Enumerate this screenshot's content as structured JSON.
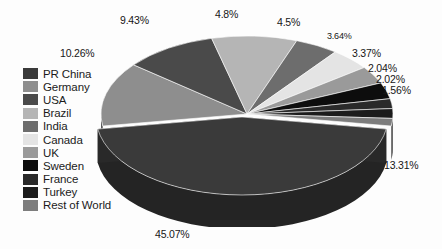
{
  "chart_data": {
    "type": "pie",
    "title": "",
    "subtitle": "",
    "xlabel": "",
    "ylabel": "",
    "style": "3d-exploded-grayscale",
    "legend_position": "left",
    "grid": false,
    "units": "percent",
    "categories": [
      "PR China",
      "Germany",
      "USA",
      "Brazil",
      "India",
      "Canada",
      "UK",
      "Sweden",
      "France",
      "Turkey",
      "Rest of World"
    ],
    "values": [
      45.07,
      13.31,
      10.26,
      9.43,
      4.8,
      4.5,
      3.64,
      3.37,
      2.04,
      2.02,
      1.56
    ],
    "labels": [
      "45.07%",
      "13.31%",
      "10.26%",
      "9.43%",
      "4.8%",
      "4.5%",
      "3.64%",
      "3.37%",
      "2.04%",
      "2.02%",
      "1.56%"
    ],
    "colors": [
      "#3a3a3a",
      "#8e8e8e",
      "#4a4a4a",
      "#b5b5b5",
      "#6d6d6d",
      "#e4e4e4",
      "#9a9a9a",
      "#0d0d0d",
      "#2a2a2a",
      "#1c1c1c",
      "#7d7d7d"
    ],
    "slices": [
      {
        "name": "PR China",
        "value": 45.07,
        "label": "45.07%",
        "color": "#3a3a3a"
      },
      {
        "name": "Germany",
        "value": 13.31,
        "label": "13.31%",
        "color": "#8e8e8e"
      },
      {
        "name": "USA",
        "value": 10.26,
        "label": "10.26%",
        "color": "#4a4a4a"
      },
      {
        "name": "Brazil",
        "value": 9.43,
        "label": "9.43%",
        "color": "#b5b5b5"
      },
      {
        "name": "India",
        "value": 4.8,
        "label": "4.8%",
        "color": "#6d6d6d"
      },
      {
        "name": "Canada",
        "value": 4.5,
        "label": "4.5%",
        "color": "#e4e4e4"
      },
      {
        "name": "UK",
        "value": 3.64,
        "label": "3.64%",
        "color": "#9a9a9a"
      },
      {
        "name": "Sweden",
        "value": 3.37,
        "label": "3.37%",
        "color": "#0d0d0d"
      },
      {
        "name": "France",
        "value": 2.04,
        "label": "2.04%",
        "color": "#2a2a2a"
      },
      {
        "name": "Turkey",
        "value": 2.02,
        "label": "2.02%",
        "color": "#1c1c1c"
      },
      {
        "name": "Rest of World",
        "value": 1.56,
        "label": "1.56%",
        "color": "#7d7d7d"
      }
    ]
  },
  "legend": {
    "items": [
      {
        "label": "PR China",
        "color": "#3a3a3a"
      },
      {
        "label": "Germany",
        "color": "#8e8e8e"
      },
      {
        "label": "USA",
        "color": "#4a4a4a"
      },
      {
        "label": "Brazil",
        "color": "#b5b5b5"
      },
      {
        "label": "India",
        "color": "#6d6d6d"
      },
      {
        "label": "Canada",
        "color": "#e4e4e4"
      },
      {
        "label": "UK",
        "color": "#9a9a9a"
      },
      {
        "label": "Sweden",
        "color": "#0d0d0d"
      },
      {
        "label": "France",
        "color": "#2a2a2a"
      },
      {
        "label": "Turkey",
        "color": "#1c1c1c"
      },
      {
        "label": "Rest of World",
        "color": "#7d7d7d"
      }
    ]
  },
  "callouts": [
    {
      "label": "9.43%",
      "x": 120,
      "y": 14,
      "size": "md"
    },
    {
      "label": "4.8%",
      "x": 215,
      "y": 8,
      "size": "md"
    },
    {
      "label": "4.5%",
      "x": 277,
      "y": 16,
      "size": "md"
    },
    {
      "label": "3.64%",
      "x": 327,
      "y": 31,
      "size": "sm"
    },
    {
      "label": "3.37%",
      "x": 352,
      "y": 47,
      "size": "md"
    },
    {
      "label": "2.04%",
      "x": 368,
      "y": 62,
      "size": "md"
    },
    {
      "label": "2.02%",
      "x": 376,
      "y": 73,
      "size": "md"
    },
    {
      "label": "1.56%",
      "x": 382,
      "y": 84,
      "size": "md"
    },
    {
      "label": "10.26%",
      "x": 60,
      "y": 47,
      "size": "md"
    },
    {
      "label": "13.31%",
      "x": 384,
      "y": 159,
      "size": "md"
    },
    {
      "label": "45.07%",
      "x": 155,
      "y": 228,
      "size": "md"
    }
  ],
  "palette": {
    "background": "#fdfdfd",
    "text": "#161616"
  }
}
